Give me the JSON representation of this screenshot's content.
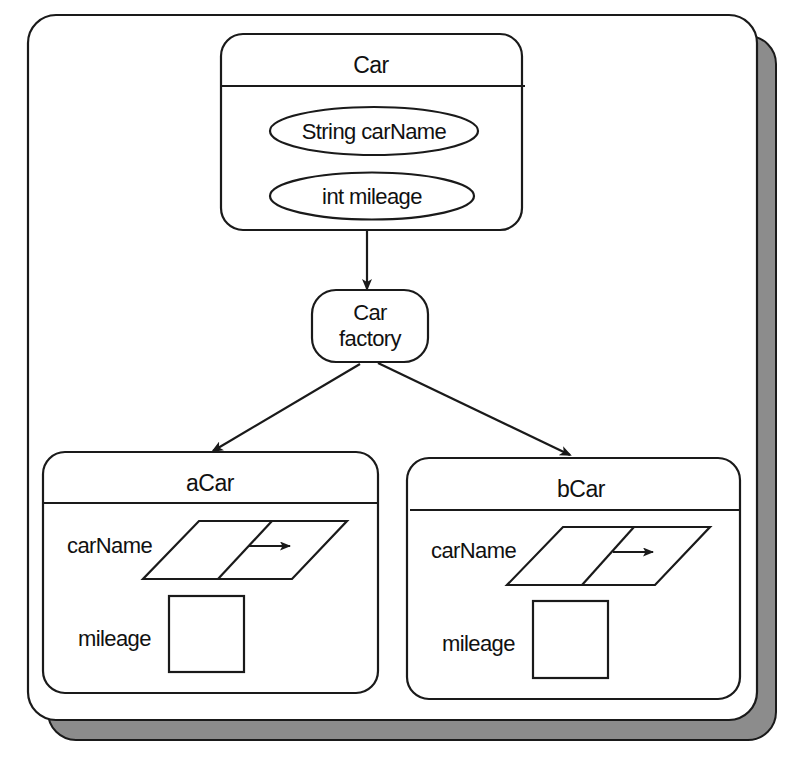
{
  "diagram": {
    "class_box": {
      "title": "Car",
      "fields": [
        "String carName",
        "int mileage"
      ]
    },
    "factory": {
      "line1": "Car",
      "line2": "factory"
    },
    "instances": [
      {
        "name": "aCar",
        "field_labels": [
          "carName",
          "mileage"
        ]
      },
      {
        "name": "bCar",
        "field_labels": [
          "carName",
          "mileage"
        ]
      }
    ],
    "colors": {
      "stroke": "#1a1a1a",
      "shadow": "#8c8c8c",
      "background": "#ffffff"
    }
  },
  "caption": ""
}
